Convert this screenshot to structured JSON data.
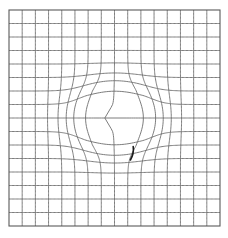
{
  "figure": {
    "title": "Deformed grid with central radial expansion",
    "type": "warped-grid-diagram",
    "canvas": {
      "width": 228,
      "height": 238,
      "background": "#ffffff"
    },
    "grid": {
      "x_min": 9,
      "y_min": 10,
      "x_max": 220,
      "y_max": 226,
      "columns": 16,
      "rows": 16,
      "cell_width": 13.19,
      "cell_height": 13.5,
      "line_color": "#6e6e6e",
      "border_color": "#5a5a5a",
      "line_width": 0.9,
      "sample_steps": 160
    },
    "deformation": {
      "model": "radial-outward-displacement",
      "center_x": 115,
      "center_y": 118,
      "core_radius": 21,
      "falloff_radius": 78,
      "strength": 20.5,
      "anisotropy_x": 1.12,
      "anisotropy_y": 0.94,
      "description": "Grid lines are pushed radially outward from the centre, opening an empty rounded-square cavity and bunching the lines into a ring around it."
    },
    "annotation_mark": {
      "name": "dark-tick-mark",
      "x1": 133.2,
      "y1": 146.5,
      "x2": 130.4,
      "y2": 160.0,
      "bow": 2.4,
      "color": "#1a1a1a",
      "width": 1.6
    }
  },
  "chart_data": {
    "type": "line",
    "title": "Deformed grid with central radial expansion",
    "xlabel": "",
    "ylabel": "",
    "xlim": [
      9,
      220
    ],
    "ylim": [
      10,
      226
    ],
    "grid": true,
    "legend": null,
    "categories": [],
    "series": [
      {
        "name": "vertical-grid-lines",
        "count": 17,
        "orientation": "vertical",
        "x_positions": [
          9,
          22.19,
          35.38,
          48.56,
          61.75,
          74.94,
          88.13,
          101.31,
          114.5,
          127.69,
          140.88,
          154.06,
          167.25,
          180.44,
          193.63,
          206.81,
          220
        ]
      },
      {
        "name": "horizontal-grid-lines",
        "count": 17,
        "orientation": "horizontal",
        "y_positions": [
          10,
          23.5,
          37,
          50.5,
          64,
          77.5,
          91,
          104.5,
          118,
          131.5,
          145,
          158.5,
          172,
          185.5,
          199,
          212.5,
          226
        ]
      }
    ]
  }
}
